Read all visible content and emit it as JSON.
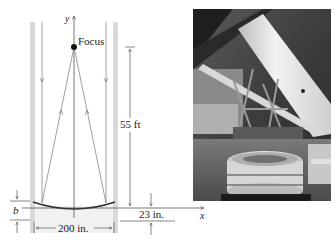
{
  "diagram": {
    "labels": {
      "y_axis": "y",
      "x_axis": "x",
      "focus": "Focus",
      "focal_length": "55 ft",
      "depth": "23 in.",
      "width": "200 in.",
      "b": "b"
    },
    "colors": {
      "wall": "#d9d9d9",
      "line": "#555555",
      "mirror": "#333333",
      "text": "#1a1a1a"
    }
  },
  "photo": {
    "description": "Telescope with large parabolic mirror"
  }
}
